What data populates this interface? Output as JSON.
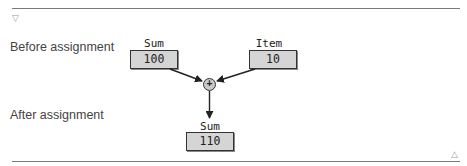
{
  "labels": {
    "before": "Before assignment",
    "after": "After assignment"
  },
  "variables": {
    "sum_before": {
      "name": "Sum",
      "value": "100"
    },
    "item": {
      "name": "Item",
      "value": "10"
    },
    "sum_after": {
      "name": "Sum",
      "value": "110"
    }
  },
  "operator": {
    "symbol": "+"
  },
  "controls": {
    "collapse_icon": "▽",
    "expand_icon": "△"
  }
}
